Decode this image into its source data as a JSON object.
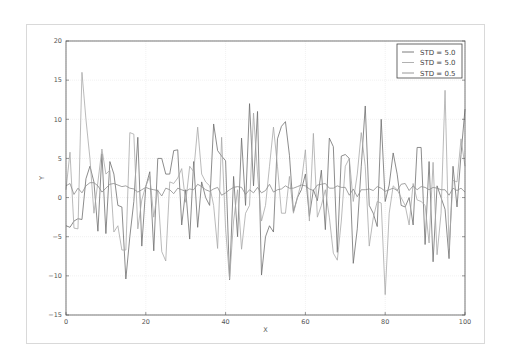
{
  "chart_data": {
    "type": "line",
    "title": "",
    "xlabel": "X",
    "ylabel": "Y",
    "xlim": [
      0,
      100
    ],
    "ylim": [
      -15,
      20
    ],
    "x_ticks": [
      0,
      20,
      40,
      60,
      80,
      100
    ],
    "y_ticks": [
      -15,
      -10,
      -5,
      0,
      5,
      10,
      15,
      20
    ],
    "grid": true,
    "legend_position": "upper right",
    "series": [
      {
        "name": "STD = 5.0",
        "color": "#6e6e6e",
        "values": [
          -3.6,
          -3.8,
          -3.0,
          -2.7,
          -2.8,
          2.4,
          4.0,
          2.0,
          -4.3,
          5.6,
          -4.6,
          4.6,
          3.0,
          -1.0,
          -1.2,
          -10.4,
          -5.0,
          -0.5,
          7.7,
          -6.2,
          1.4,
          3.3,
          -6.8,
          5.0,
          5.0,
          3.0,
          3.0,
          6.0,
          6.1,
          -3.5,
          1.0,
          -5.3,
          4.6,
          -3.8,
          2.0,
          0.0,
          -1.0,
          9.4,
          6.0,
          5.3,
          4.7,
          -10.5,
          2.7,
          -5.0,
          7.6,
          -1.0,
          12.0,
          1.5,
          11.0,
          -9.9,
          -5.0,
          -3.6,
          -4.4,
          7.5,
          9.1,
          9.7,
          5.4,
          -1.8,
          0.0,
          1.0,
          3.0,
          -2.4,
          1.0,
          -0.4,
          3.5,
          -4.1,
          7.6,
          6.5,
          -7.0,
          5.3,
          5.5,
          5.0,
          -8.4,
          -4.0,
          4.0,
          11.7,
          -1.0,
          -2.0,
          -3.7,
          10.0,
          -0.5,
          1.6,
          5.7,
          3.0,
          -1.0,
          -1.2,
          0.0,
          -3.5,
          6.4,
          6.4,
          -6.0,
          4.6,
          -8.2,
          1.5,
          0.0,
          -1.5,
          -7.8,
          4.0,
          -1.2,
          5.5,
          11.3
        ]
      },
      {
        "name": "STD = 5.0",
        "color": "#a8a8a8",
        "values": [
          1.0,
          5.8,
          -3.9,
          -4.0,
          16.0,
          10.0,
          5.0,
          -2.0,
          2.0,
          6.2,
          3.0,
          3.5,
          -4.4,
          -3.6,
          -6.7,
          -6.7,
          8.3,
          8.1,
          -4.0,
          -0.3,
          1.5,
          2.7,
          -2.5,
          1.0,
          -6.9,
          -8.1,
          2.0,
          1.8,
          2.5,
          3.7,
          -0.6,
          4.0,
          3.3,
          9.0,
          3.0,
          2.0,
          1.5,
          -1.0,
          -6.5,
          7.7,
          -4.0,
          -10.4,
          -3.0,
          1.0,
          -6.6,
          -2.0,
          -1.0,
          10.8,
          3.0,
          -3.0,
          -1.0,
          4.0,
          9.0,
          4.0,
          -2.0,
          -2.0,
          2.7,
          -2.0,
          0.0,
          2.0,
          6.1,
          -3.0,
          8.2,
          -2.5,
          -1.0,
          1.0,
          -2.5,
          -7.1,
          -8.0,
          -3.0,
          4.0,
          5.0,
          -0.5,
          3.0,
          8.3,
          4.0,
          -6.2,
          -2.6,
          -0.5,
          -0.7,
          -12.4,
          -2.0,
          1.5,
          1.0,
          0.0,
          -1.0,
          -3.5,
          1.8,
          -0.3,
          -0.5,
          -1.0,
          -5.8,
          4.5,
          -7.3,
          -2.0,
          13.7,
          -6.5,
          2.2,
          2.0,
          7.5,
          4.0
        ]
      },
      {
        "name": "STD = 0.5",
        "color": "#8c8c8c",
        "values": [
          1.5,
          1.8,
          0.4,
          1.2,
          0.6,
          1.5,
          1.9,
          1.9,
          1.5,
          0.7,
          1.2,
          1.7,
          1.8,
          1.6,
          1.4,
          1.5,
          1.2,
          1.1,
          0.7,
          1.0,
          1.3,
          1.1,
          1.0,
          0.9,
          0.2,
          1.2,
          1.0,
          0.5,
          1.2,
          1.0,
          0.8,
          1.1,
          1.0,
          1.7,
          1.4,
          1.0,
          0.8,
          1.1,
          1.3,
          0.3,
          0.6,
          1.0,
          1.3,
          1.4,
          1.3,
          0.4,
          1.0,
          0.6,
          1.3,
          0.6,
          0.9,
          1.7,
          0.7,
          1.0,
          1.1,
          1.5,
          1.2,
          1.2,
          1.4,
          1.6,
          1.5,
          1.1,
          0.9,
          1.6,
          1.7,
          1.8,
          1.2,
          1.2,
          1.5,
          1.3,
          1.3,
          0.3,
          1.1,
          0.1,
          1.0,
          1.0,
          1.1,
          0.9,
          1.4,
          1.2,
          0.8,
          1.0,
          1.2,
          0.9,
          1.7,
          1.8,
          0.9,
          1.5,
          1.0,
          1.4,
          1.3,
          1.0,
          1.3,
          1.2,
          1.0,
          1.0,
          0.3,
          1.2,
          0.9,
          1.2,
          0.7
        ]
      }
    ]
  },
  "legend": {
    "entries": [
      "STD = 5.0",
      "STD = 5.0",
      "STD = 0.5"
    ]
  },
  "axes": {
    "xlabel": "X",
    "ylabel": "Y"
  }
}
